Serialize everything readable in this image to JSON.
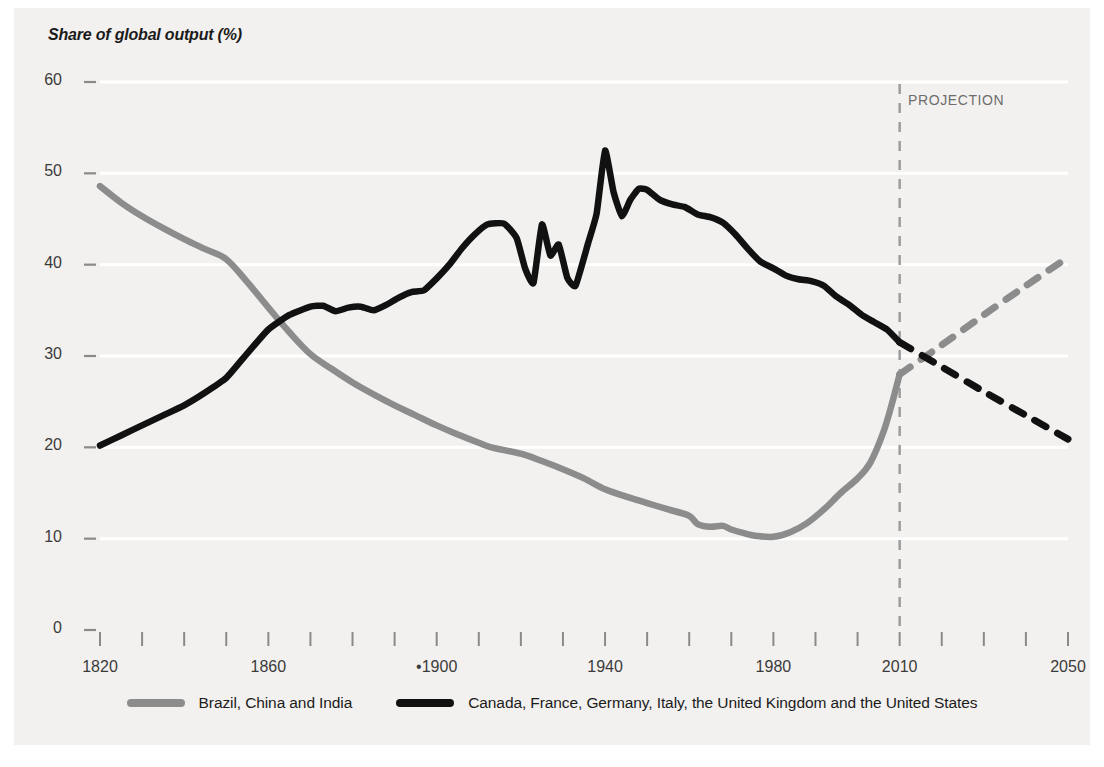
{
  "chart_data": {
    "type": "line",
    "title": "Share of global output (%)",
    "xlabel": "",
    "ylabel": "Share of global output (%)",
    "xlim": [
      1820,
      2050
    ],
    "ylim": [
      0,
      60
    ],
    "yticks": [
      0,
      10,
      20,
      30,
      40,
      50,
      60
    ],
    "ytick_labels": [
      "0",
      "10",
      "20",
      "30",
      "40",
      "50",
      "60"
    ],
    "xticks": [
      1820,
      1860,
      1900,
      1940,
      1980,
      2010,
      2050
    ],
    "xtick_labels": [
      "1820",
      "1860",
      "•1900",
      "1940",
      "1980",
      "2010",
      "2050"
    ],
    "xtick_minor_step": 10,
    "grid": "horizontal-white",
    "legend_position": "bottom-center",
    "annotations": [
      {
        "text": "PROJECTION",
        "x": 2018,
        "y": 56
      }
    ],
    "projection_divider_x": 2010,
    "series": [
      {
        "name": "Brazil, China and India",
        "color": "#8c8c8c",
        "historical": [
          [
            1820,
            48.6
          ],
          [
            1825,
            46.8
          ],
          [
            1830,
            45.3
          ],
          [
            1835,
            44.0
          ],
          [
            1840,
            42.8
          ],
          [
            1845,
            41.7
          ],
          [
            1850,
            40.6
          ],
          [
            1855,
            38.1
          ],
          [
            1860,
            35.3
          ],
          [
            1865,
            32.6
          ],
          [
            1870,
            30.2
          ],
          [
            1875,
            28.6
          ],
          [
            1880,
            27.1
          ],
          [
            1885,
            25.8
          ],
          [
            1890,
            24.6
          ],
          [
            1895,
            23.5
          ],
          [
            1900,
            22.4
          ],
          [
            1905,
            21.4
          ],
          [
            1910,
            20.5
          ],
          [
            1913,
            20.0
          ],
          [
            1920,
            19.3
          ],
          [
            1925,
            18.5
          ],
          [
            1930,
            17.6
          ],
          [
            1935,
            16.6
          ],
          [
            1940,
            15.4
          ],
          [
            1945,
            14.6
          ],
          [
            1950,
            13.9
          ],
          [
            1955,
            13.2
          ],
          [
            1960,
            12.5
          ],
          [
            1962,
            11.6
          ],
          [
            1965,
            11.3
          ],
          [
            1968,
            11.4
          ],
          [
            1970,
            11.0
          ],
          [
            1973,
            10.6
          ],
          [
            1976,
            10.3
          ],
          [
            1980,
            10.2
          ],
          [
            1984,
            10.7
          ],
          [
            1988,
            11.7
          ],
          [
            1992,
            13.2
          ],
          [
            1996,
            15.0
          ],
          [
            2000,
            16.6
          ],
          [
            2003,
            18.3
          ],
          [
            2006,
            21.5
          ],
          [
            2008,
            24.5
          ],
          [
            2010,
            28.0
          ]
        ],
        "projection": [
          [
            2010,
            28.0
          ],
          [
            2020,
            31.2
          ],
          [
            2030,
            34.5
          ],
          [
            2040,
            37.7
          ],
          [
            2050,
            40.8
          ]
        ]
      },
      {
        "name": "Canada, France, Germany, Italy, the United Kingdom and the United States",
        "color": "#111111",
        "historical": [
          [
            1820,
            20.2
          ],
          [
            1825,
            21.3
          ],
          [
            1830,
            22.4
          ],
          [
            1835,
            23.5
          ],
          [
            1840,
            24.6
          ],
          [
            1845,
            26.0
          ],
          [
            1850,
            27.6
          ],
          [
            1855,
            30.3
          ],
          [
            1860,
            32.9
          ],
          [
            1865,
            34.5
          ],
          [
            1870,
            35.4
          ],
          [
            1873,
            35.5
          ],
          [
            1876,
            34.9
          ],
          [
            1879,
            35.3
          ],
          [
            1882,
            35.4
          ],
          [
            1885,
            35.0
          ],
          [
            1888,
            35.6
          ],
          [
            1891,
            36.4
          ],
          [
            1894,
            37.0
          ],
          [
            1897,
            37.2
          ],
          [
            1900,
            38.5
          ],
          [
            1903,
            40.0
          ],
          [
            1906,
            41.8
          ],
          [
            1909,
            43.3
          ],
          [
            1912,
            44.4
          ],
          [
            1916,
            44.5
          ],
          [
            1919,
            42.9
          ],
          [
            1921,
            39.6
          ],
          [
            1923,
            38.0
          ],
          [
            1925,
            44.4
          ],
          [
            1927,
            41.0
          ],
          [
            1929,
            42.2
          ],
          [
            1931,
            38.6
          ],
          [
            1933,
            37.7
          ],
          [
            1936,
            42.4
          ],
          [
            1938,
            45.6
          ],
          [
            1940,
            52.5
          ],
          [
            1942,
            48.0
          ],
          [
            1944,
            45.3
          ],
          [
            1946,
            47.1
          ],
          [
            1948,
            48.3
          ],
          [
            1950,
            48.2
          ],
          [
            1953,
            47.1
          ],
          [
            1956,
            46.6
          ],
          [
            1959,
            46.3
          ],
          [
            1962,
            45.5
          ],
          [
            1965,
            45.2
          ],
          [
            1968,
            44.6
          ],
          [
            1971,
            43.3
          ],
          [
            1974,
            41.7
          ],
          [
            1977,
            40.3
          ],
          [
            1980,
            39.6
          ],
          [
            1983,
            38.8
          ],
          [
            1986,
            38.4
          ],
          [
            1989,
            38.2
          ],
          [
            1992,
            37.7
          ],
          [
            1995,
            36.5
          ],
          [
            1998,
            35.6
          ],
          [
            2001,
            34.5
          ],
          [
            2004,
            33.7
          ],
          [
            2007,
            32.9
          ],
          [
            2010,
            31.5
          ]
        ],
        "projection": [
          [
            2010,
            31.5
          ],
          [
            2020,
            28.8
          ],
          [
            2030,
            26.1
          ],
          [
            2040,
            23.5
          ],
          [
            2050,
            20.9
          ]
        ]
      }
    ]
  },
  "legend": [
    {
      "label": "Brazil, China and India",
      "color": "#8c8c8c"
    },
    {
      "label": "Canada, France, Germany, Italy, the United Kingdom and the United States",
      "color": "#111111"
    }
  ],
  "colors": {
    "background": "#ffffff",
    "panel": "#f3f1ef",
    "gridline": "#ffffff",
    "axis": "#8a8a8a",
    "emerging": "#8c8c8c",
    "advanced": "#111111",
    "annotation": "#6d6d6d"
  }
}
